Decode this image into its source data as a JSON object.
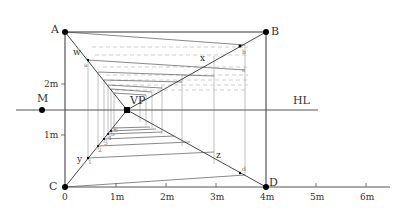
{
  "diagram": {
    "points": {
      "A": {
        "label": "A",
        "x": 65,
        "y": 32
      },
      "B": {
        "label": "B",
        "x": 266,
        "y": 32
      },
      "C": {
        "label": "C",
        "x": 65,
        "y": 187
      },
      "D": {
        "label": "D",
        "x": 266,
        "y": 187
      },
      "VP": {
        "label": "VP",
        "x": 127,
        "y": 110
      },
      "M": {
        "label": "M",
        "x": 42,
        "y": 110
      }
    },
    "horizon": {
      "label": "HL",
      "y": 110,
      "x1": 16,
      "x2": 318
    },
    "diagonal_labels": {
      "w": "w",
      "x": "x",
      "y": "y",
      "z": "z"
    },
    "corner_marks": {
      "b": "b",
      "c": "c",
      "a": "a",
      "d": "d"
    },
    "depth_marks": [
      "1",
      "2",
      "3",
      "4",
      "5",
      "6"
    ],
    "ground_axis": {
      "origin_label": "0",
      "ticks": [
        {
          "label": "1m",
          "x": 116
        },
        {
          "label": "2m",
          "x": 166
        },
        {
          "label": "3m",
          "x": 216
        },
        {
          "label": "4m",
          "x": 266
        },
        {
          "label": "5m",
          "x": 316
        },
        {
          "label": "6m",
          "x": 366
        }
      ]
    },
    "vertical_axis": {
      "ticks": [
        {
          "label": "1m",
          "y": 135
        },
        {
          "label": "2m",
          "y": 84
        }
      ]
    },
    "colors": {
      "line": "#333333",
      "thin": "#888888",
      "dashed": "#aaaaaa",
      "dot": "#000000"
    }
  }
}
